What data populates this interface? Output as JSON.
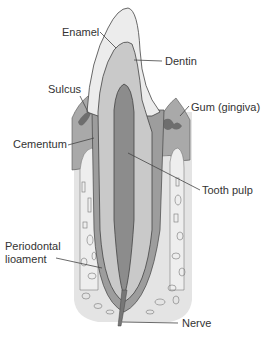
{
  "diagram": {
    "labels": {
      "enamel": "Enamel",
      "dentin": "Dentin",
      "sulcus": "Sulcus",
      "gum": "Gum (gingiva)",
      "cementum": "Cementum",
      "tooth_pulp": "Tooth pulp",
      "periodontal_1": "Periodontal",
      "periodontal_2": "lioament",
      "nerve": "Nerve"
    },
    "colors": {
      "enamel": "#ececec",
      "dentin": "#c9c9c9",
      "pulp": "#8c8c8c",
      "gum": "#a9a9a9",
      "gum_dark": "#6e6e6e",
      "bone": "#e2e2e2",
      "ligament": "#9d9d9d",
      "outline": "#444444"
    }
  }
}
